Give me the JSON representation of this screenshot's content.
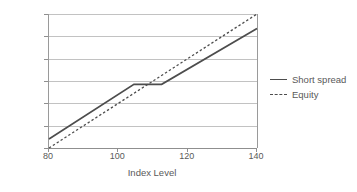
{
  "chart_data": {
    "type": "line",
    "title": "",
    "xlabel": "Index Level",
    "ylabel": "",
    "xlim": [
      80,
      140
    ],
    "ylim": [
      -0.2,
      0.4
    ],
    "grid": true,
    "legend_position": "right",
    "x_ticks": [
      {
        "value": 80,
        "label": "80"
      },
      {
        "value": 100,
        "label": "100"
      },
      {
        "value": 120,
        "label": "120"
      },
      {
        "value": 140,
        "label": "140"
      }
    ],
    "y_ticks": [
      {
        "value": 0.4,
        "label": "40%"
      },
      {
        "value": 0.3,
        "label": "30%"
      },
      {
        "value": 0.2,
        "label": "20%"
      },
      {
        "value": 0.1,
        "label": "10%"
      },
      {
        "value": 0.0,
        "label": "0%"
      },
      {
        "value": -0.1,
        "label": "-10%"
      },
      {
        "value": -0.2,
        "label": "-20%"
      }
    ],
    "series": [
      {
        "name": "Short spread",
        "style": "solid",
        "color": "#4d4d4d",
        "points": [
          {
            "x": 80,
            "y": -0.16
          },
          {
            "x": 104.5,
            "y": 0.085
          },
          {
            "x": 112.5,
            "y": 0.085
          },
          {
            "x": 140,
            "y": 0.335
          }
        ]
      },
      {
        "name": "Equity",
        "style": "dashed",
        "color": "#4d4d4d",
        "points": [
          {
            "x": 80,
            "y": -0.2
          },
          {
            "x": 140,
            "y": 0.4
          }
        ]
      }
    ]
  },
  "legend": {
    "items": [
      {
        "label": "Short spread",
        "style": "solid"
      },
      {
        "label": "Equity",
        "style": "dashed"
      }
    ]
  },
  "axes": {
    "x_title": "Index Level"
  }
}
